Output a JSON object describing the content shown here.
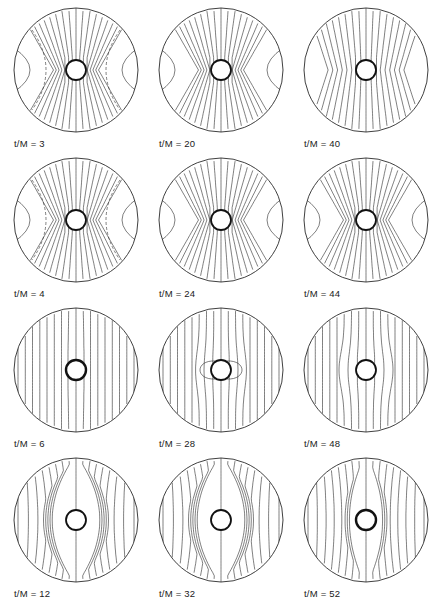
{
  "figure": {
    "layout": {
      "rows": 4,
      "cols": 3
    },
    "label_prefix": "t/M = ",
    "panels": [
      {
        "id": "p1",
        "t_over_M": "3",
        "label": "t/M = 3",
        "x": 12,
        "y": 6,
        "style": "hourglass",
        "dashed": true,
        "lobes": true
      },
      {
        "id": "p2",
        "t_over_M": "20",
        "label": "t/M = 20",
        "x": 157,
        "y": 6,
        "style": "hourglass",
        "dashed": false,
        "lobes": true
      },
      {
        "id": "p3",
        "t_over_M": "40",
        "label": "t/M = 40",
        "x": 302,
        "y": 6,
        "style": "pinched",
        "dashed": false,
        "lobes": false
      },
      {
        "id": "p4",
        "t_over_M": "4",
        "label": "t/M = 4",
        "x": 12,
        "y": 156,
        "style": "hourglass",
        "dashed": true,
        "lobes": true
      },
      {
        "id": "p5",
        "t_over_M": "24",
        "label": "t/M = 24",
        "x": 157,
        "y": 156,
        "style": "hourglass",
        "dashed": false,
        "lobes": true
      },
      {
        "id": "p6",
        "t_over_M": "44",
        "label": "t/M = 44",
        "x": 302,
        "y": 156,
        "style": "hourglass",
        "dashed": false,
        "lobes": true
      },
      {
        "id": "p7",
        "t_over_M": "6",
        "label": "t/M = 6",
        "x": 12,
        "y": 306,
        "style": "vertical",
        "dashed": false,
        "lobes": false
      },
      {
        "id": "p8",
        "t_over_M": "28",
        "label": "t/M = 28",
        "x": 157,
        "y": 306,
        "style": "dipole",
        "dashed": false,
        "lobes": false
      },
      {
        "id": "p9",
        "t_over_M": "48",
        "label": "t/M = 48",
        "x": 302,
        "y": 306,
        "style": "flared",
        "dashed": false,
        "lobes": false
      },
      {
        "id": "p10",
        "t_over_M": "12",
        "label": "t/M = 12",
        "x": 12,
        "y": 456,
        "style": "barrel",
        "dashed": false,
        "lobes": false
      },
      {
        "id": "p11",
        "t_over_M": "32",
        "label": "t/M = 32",
        "x": 157,
        "y": 456,
        "style": "barrel",
        "dashed": false,
        "lobes": false
      },
      {
        "id": "p12",
        "t_over_M": "52",
        "label": "t/M = 52",
        "x": 302,
        "y": 456,
        "style": "barrel2",
        "dashed": false,
        "lobes": false
      }
    ],
    "colors": {
      "line": "#2a2a2a",
      "background": "#ffffff"
    }
  }
}
